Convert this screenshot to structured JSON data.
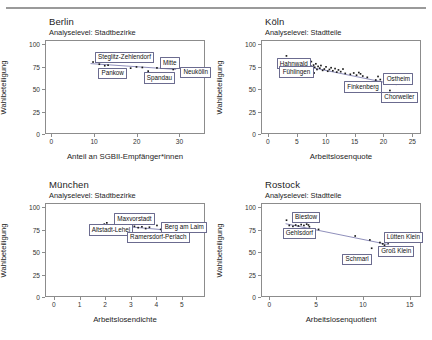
{
  "figure": {
    "panel_subtitle_prefix": "Analyselevel:",
    "y_axis_label": "Wahlbeteiligung",
    "y_ticks": [
      "0",
      "25",
      "50",
      "75",
      "100"
    ]
  },
  "chart_data": [
    {
      "type": "scatter",
      "title": "Berlin",
      "subtitle": "Analyselevel: Stadtbezirke",
      "xlabel": "Anteil an SGBII-Empfänger*innen",
      "ylabel": "Wahlbeteiligung",
      "xlim": [
        -1.5,
        36
      ],
      "ylim": [
        0,
        105
      ],
      "xticks": [
        0,
        10,
        20,
        30
      ],
      "yticks": [
        0,
        25,
        50,
        75,
        100
      ],
      "grid": false,
      "legend": "none",
      "points": [
        {
          "x": 9.6,
          "y": 81.0
        },
        {
          "x": 11.1,
          "y": 78.5
        },
        {
          "x": 12.4,
          "y": 76.8
        },
        {
          "x": 13.2,
          "y": 77.4
        },
        {
          "x": 18.6,
          "y": 74.0
        },
        {
          "x": 20.0,
          "y": 75.4
        },
        {
          "x": 21.4,
          "y": 74.8
        },
        {
          "x": 22.8,
          "y": 70.6
        },
        {
          "x": 24.9,
          "y": 74.3
        },
        {
          "x": 26.2,
          "y": 75.0
        },
        {
          "x": 28.8,
          "y": 72.5
        }
      ],
      "trendline": {
        "x0": 9.0,
        "y0": 79.2,
        "x1": 29.5,
        "y1": 72.6
      },
      "annotations": [
        {
          "label": "Steglitz-Zehlendorf",
          "x": 10.2,
          "y": 87.5
        },
        {
          "label": "Pankow",
          "x": 11.0,
          "y": 69.5
        },
        {
          "label": "Mitte",
          "x": 25.4,
          "y": 81.0
        },
        {
          "label": "Spandau",
          "x": 21.6,
          "y": 64.5
        },
        {
          "label": "Neukölln",
          "x": 30.2,
          "y": 70.5
        }
      ]
    },
    {
      "type": "scatter",
      "title": "Köln",
      "subtitle": "Analyselevel: Stadtteile",
      "xlabel": "Arbeitslosenquote",
      "ylabel": "Wahlbeteiligung",
      "xlim": [
        -1.2,
        26.5
      ],
      "ylim": [
        0,
        105
      ],
      "xticks": [
        0,
        5,
        10,
        15,
        20,
        25
      ],
      "yticks": [
        0,
        25,
        50,
        75,
        100
      ],
      "grid": false,
      "legend": "none",
      "points": [
        {
          "x": 3.0,
          "y": 88.0
        },
        {
          "x": 4.3,
          "y": 82.0
        },
        {
          "x": 4.6,
          "y": 80.5
        },
        {
          "x": 5.0,
          "y": 84.5
        },
        {
          "x": 5.1,
          "y": 79.0
        },
        {
          "x": 5.3,
          "y": 81.5
        },
        {
          "x": 5.4,
          "y": 77.0
        },
        {
          "x": 5.5,
          "y": 83.0
        },
        {
          "x": 5.6,
          "y": 78.5
        },
        {
          "x": 5.8,
          "y": 80.0
        },
        {
          "x": 5.9,
          "y": 76.0
        },
        {
          "x": 6.0,
          "y": 82.5
        },
        {
          "x": 6.1,
          "y": 79.5
        },
        {
          "x": 6.2,
          "y": 77.5
        },
        {
          "x": 6.3,
          "y": 81.0
        },
        {
          "x": 6.4,
          "y": 75.5
        },
        {
          "x": 6.5,
          "y": 79.0
        },
        {
          "x": 6.6,
          "y": 83.5
        },
        {
          "x": 6.7,
          "y": 77.0
        },
        {
          "x": 6.9,
          "y": 80.5
        },
        {
          "x": 7.0,
          "y": 74.5
        },
        {
          "x": 7.1,
          "y": 78.0
        },
        {
          "x": 7.3,
          "y": 76.5
        },
        {
          "x": 7.4,
          "y": 81.5
        },
        {
          "x": 7.6,
          "y": 73.5
        },
        {
          "x": 7.8,
          "y": 77.5
        },
        {
          "x": 8.0,
          "y": 75.0
        },
        {
          "x": 8.2,
          "y": 79.0
        },
        {
          "x": 8.4,
          "y": 72.5
        },
        {
          "x": 8.6,
          "y": 76.0
        },
        {
          "x": 8.9,
          "y": 74.0
        },
        {
          "x": 9.1,
          "y": 77.0
        },
        {
          "x": 9.4,
          "y": 71.5
        },
        {
          "x": 9.7,
          "y": 73.0
        },
        {
          "x": 10.0,
          "y": 75.5
        },
        {
          "x": 10.3,
          "y": 70.5
        },
        {
          "x": 10.6,
          "y": 72.5
        },
        {
          "x": 10.9,
          "y": 74.5
        },
        {
          "x": 11.2,
          "y": 71.0
        },
        {
          "x": 11.6,
          "y": 73.5
        },
        {
          "x": 11.9,
          "y": 69.5
        },
        {
          "x": 12.2,
          "y": 72.0
        },
        {
          "x": 12.6,
          "y": 70.0
        },
        {
          "x": 13.0,
          "y": 73.0
        },
        {
          "x": 13.4,
          "y": 68.0
        },
        {
          "x": 6.8,
          "y": 67.5
        },
        {
          "x": 7.9,
          "y": 68.5
        },
        {
          "x": 5.2,
          "y": 72.0
        },
        {
          "x": 14.3,
          "y": 67.0
        },
        {
          "x": 14.9,
          "y": 68.5
        },
        {
          "x": 15.4,
          "y": 66.0
        },
        {
          "x": 15.8,
          "y": 69.0
        },
        {
          "x": 16.1,
          "y": 67.5
        },
        {
          "x": 16.5,
          "y": 65.0
        },
        {
          "x": 17.3,
          "y": 63.5
        },
        {
          "x": 18.8,
          "y": 60.5
        },
        {
          "x": 19.2,
          "y": 64.5
        },
        {
          "x": 19.6,
          "y": 61.0
        },
        {
          "x": 21.3,
          "y": 48.5
        }
      ],
      "trendline": {
        "x0": 3.0,
        "y0": 80.5,
        "x1": 22.5,
        "y1": 55.0
      },
      "annotations": [
        {
          "label": "Hahnwald",
          "x": 1.5,
          "y": 80.5
        },
        {
          "label": "Fühlingen",
          "x": 2.0,
          "y": 71.0
        },
        {
          "label": "Ostheim",
          "x": 20.0,
          "y": 63.5
        },
        {
          "label": "Finkenberg",
          "x": 13.2,
          "y": 54.5
        },
        {
          "label": "Chorweiler",
          "x": 19.6,
          "y": 43.0
        }
      ]
    },
    {
      "type": "scatter",
      "title": "München",
      "subtitle": "Analyselevel: Stadtbezirke",
      "xlabel": "Arbeitslosendichte",
      "ylabel": "Wahlbeteiligung",
      "xlim": [
        -0.35,
        5.9
      ],
      "ylim": [
        0,
        105
      ],
      "xticks": [
        0,
        1,
        2,
        3,
        4,
        5
      ],
      "yticks": [
        0,
        25,
        50,
        75,
        100
      ],
      "grid": false,
      "legend": "none",
      "points": [
        {
          "x": 1.95,
          "y": 82.0
        },
        {
          "x": 2.05,
          "y": 83.5
        },
        {
          "x": 2.2,
          "y": 81.0
        },
        {
          "x": 2.45,
          "y": 82.5
        },
        {
          "x": 2.6,
          "y": 80.5
        },
        {
          "x": 2.75,
          "y": 81.5
        },
        {
          "x": 2.85,
          "y": 79.5
        },
        {
          "x": 2.95,
          "y": 80.0
        },
        {
          "x": 3.05,
          "y": 78.5
        },
        {
          "x": 3.15,
          "y": 79.5
        },
        {
          "x": 3.3,
          "y": 78.0
        },
        {
          "x": 3.45,
          "y": 79.0
        },
        {
          "x": 3.6,
          "y": 77.0
        },
        {
          "x": 3.75,
          "y": 78.5
        },
        {
          "x": 4.05,
          "y": 80.5
        },
        {
          "x": 4.2,
          "y": 76.0
        },
        {
          "x": 4.3,
          "y": 74.5
        }
      ],
      "trendline": {
        "x0": 1.9,
        "y0": 81.5,
        "x1": 4.35,
        "y1": 75.5
      },
      "annotations": [
        {
          "label": "Maxvorstadt",
          "x": 2.35,
          "y": 89.0
        },
        {
          "label": "Altstadt-Lehel",
          "x": 1.35,
          "y": 77.0
        },
        {
          "label": "Berg am Laim",
          "x": 4.2,
          "y": 79.5
        },
        {
          "label": "Ramersdorf-Perlach",
          "x": 2.85,
          "y": 68.5
        }
      ]
    },
    {
      "type": "scatter",
      "title": "Rostock",
      "subtitle": "Analyselevel: Stadtteile",
      "xlabel": "Arbeitslosenquotient",
      "ylabel": "Wahlbeteiligung",
      "xlim": [
        -0.9,
        16.2
      ],
      "ylim": [
        0,
        105
      ],
      "xticks": [
        0,
        5,
        10,
        15
      ],
      "yticks": [
        0,
        25,
        50,
        75,
        100
      ],
      "grid": false,
      "legend": "none",
      "points": [
        {
          "x": 1.7,
          "y": 86.5
        },
        {
          "x": 2.0,
          "y": 80.5
        },
        {
          "x": 2.4,
          "y": 79.5
        },
        {
          "x": 2.7,
          "y": 81.0
        },
        {
          "x": 3.0,
          "y": 80.0
        },
        {
          "x": 3.3,
          "y": 81.5
        },
        {
          "x": 3.6,
          "y": 80.5
        },
        {
          "x": 3.9,
          "y": 82.0
        },
        {
          "x": 4.1,
          "y": 81.0
        },
        {
          "x": 4.2,
          "y": 79.0
        },
        {
          "x": 5.2,
          "y": 76.0
        },
        {
          "x": 9.2,
          "y": 68.5
        },
        {
          "x": 10.8,
          "y": 64.0
        },
        {
          "x": 11.0,
          "y": 54.5
        },
        {
          "x": 11.9,
          "y": 61.0
        },
        {
          "x": 12.2,
          "y": 59.5
        },
        {
          "x": 12.4,
          "y": 58.0
        },
        {
          "x": 12.8,
          "y": 60.5
        }
      ],
      "trendline": {
        "x0": 1.6,
        "y0": 82.5,
        "x1": 12.9,
        "y1": 58.5
      },
      "annotations": [
        {
          "label": "Biestow",
          "x": 2.4,
          "y": 91.0
        },
        {
          "label": "Gehlsdorf",
          "x": 1.4,
          "y": 73.0
        },
        {
          "label": "Lütten Klein",
          "x": 12.2,
          "y": 68.5
        },
        {
          "label": "Groß Klein",
          "x": 11.6,
          "y": 53.0
        },
        {
          "label": "Schmarl",
          "x": 7.8,
          "y": 44.0
        }
      ]
    }
  ]
}
